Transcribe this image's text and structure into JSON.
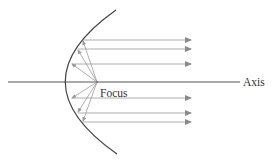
{
  "diagram": {
    "labels": {
      "focus": "Focus",
      "axis": "Axis"
    },
    "colors": {
      "background": "#ffffff",
      "curve": "#444444",
      "axis": "#555555",
      "rays": "#9a9a9a",
      "text": "#333333"
    },
    "rays": {
      "count": 6,
      "above_axis_y": [
        40,
        49,
        64
      ],
      "below_axis_y": [
        98,
        113,
        122
      ]
    }
  }
}
